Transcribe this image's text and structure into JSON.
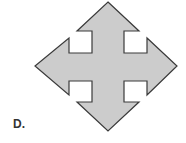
{
  "figure": {
    "option_label": "D.",
    "shape": "four-way-arrow",
    "fill_color": "#cccccc",
    "stroke_color": "#3a3a3a"
  }
}
